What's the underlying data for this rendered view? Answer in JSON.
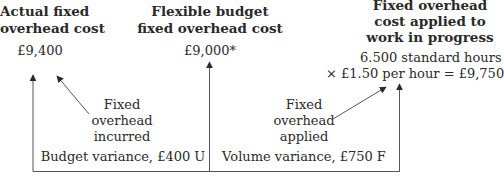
{
  "columns": [
    {
      "title_line1": "Actual fixed",
      "title_line2": "overhead cost",
      "value": "£9,400"
    },
    {
      "title_line1": "Flexible budget",
      "title_line2": "fixed overhead cost",
      "value": "£9,000*"
    },
    {
      "title_line1": "Fixed overhead",
      "title_line2": "cost applied to",
      "title_line3": "work in progress",
      "value_line1": "6.500 standard hours",
      "value_line2": "× £1.50 per hour =  £9,750"
    }
  ],
  "annotations": {
    "incurred": [
      "Fixed",
      "overhead",
      "incurred"
    ],
    "applied": [
      "Fixed",
      "overhead",
      "applied"
    ]
  },
  "variances": {
    "budget": "Budget variance, £400 U",
    "volume": "Volume variance, £750 F"
  },
  "colors": {
    "text": "#2a2a2a",
    "lines": "#555555"
  }
}
